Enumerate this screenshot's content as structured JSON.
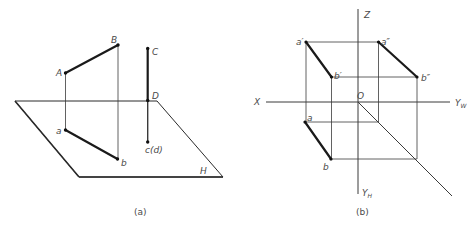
{
  "panel_a": {
    "caption": "(a)",
    "plane_label": "H",
    "points": {
      "A": "A",
      "B": "B",
      "C": "C",
      "D": "D",
      "a": "a",
      "b": "b",
      "cd": "c(d)"
    }
  },
  "panel_b": {
    "caption": "(b)",
    "axes": {
      "z": "Z",
      "x": "X",
      "origin": "O",
      "yw_main": "Y",
      "yw_sub": "W",
      "yh_main": "Y",
      "yh_sub": "H"
    },
    "points": {
      "a_prime": "a′",
      "a_dprime": "a″",
      "b_prime": "b′",
      "b_dprime": "b″",
      "a": "a",
      "b": "b"
    }
  }
}
